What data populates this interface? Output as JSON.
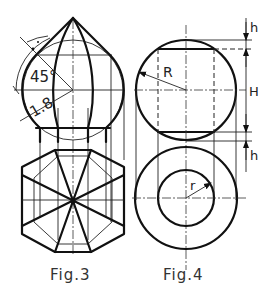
{
  "figures": [
    {
      "id": "fig3",
      "caption": "Fig.3",
      "description": "Onion dome (pointed sphere) front view with octagonal plan view",
      "dimensions": {
        "angle": "45°",
        "ratio": "1.8"
      }
    },
    {
      "id": "fig4",
      "caption": "Fig.4",
      "description": "Sphere with flattened top and bottom, front view and plan view with inner hole",
      "dimensions": {
        "sphere_radius": "R",
        "inner_radius": "r",
        "cap_height_top": "h",
        "middle_height": "H",
        "cap_height_bottom": "h"
      }
    }
  ],
  "colors": {
    "line": "#111111",
    "background": "#ffffff"
  }
}
